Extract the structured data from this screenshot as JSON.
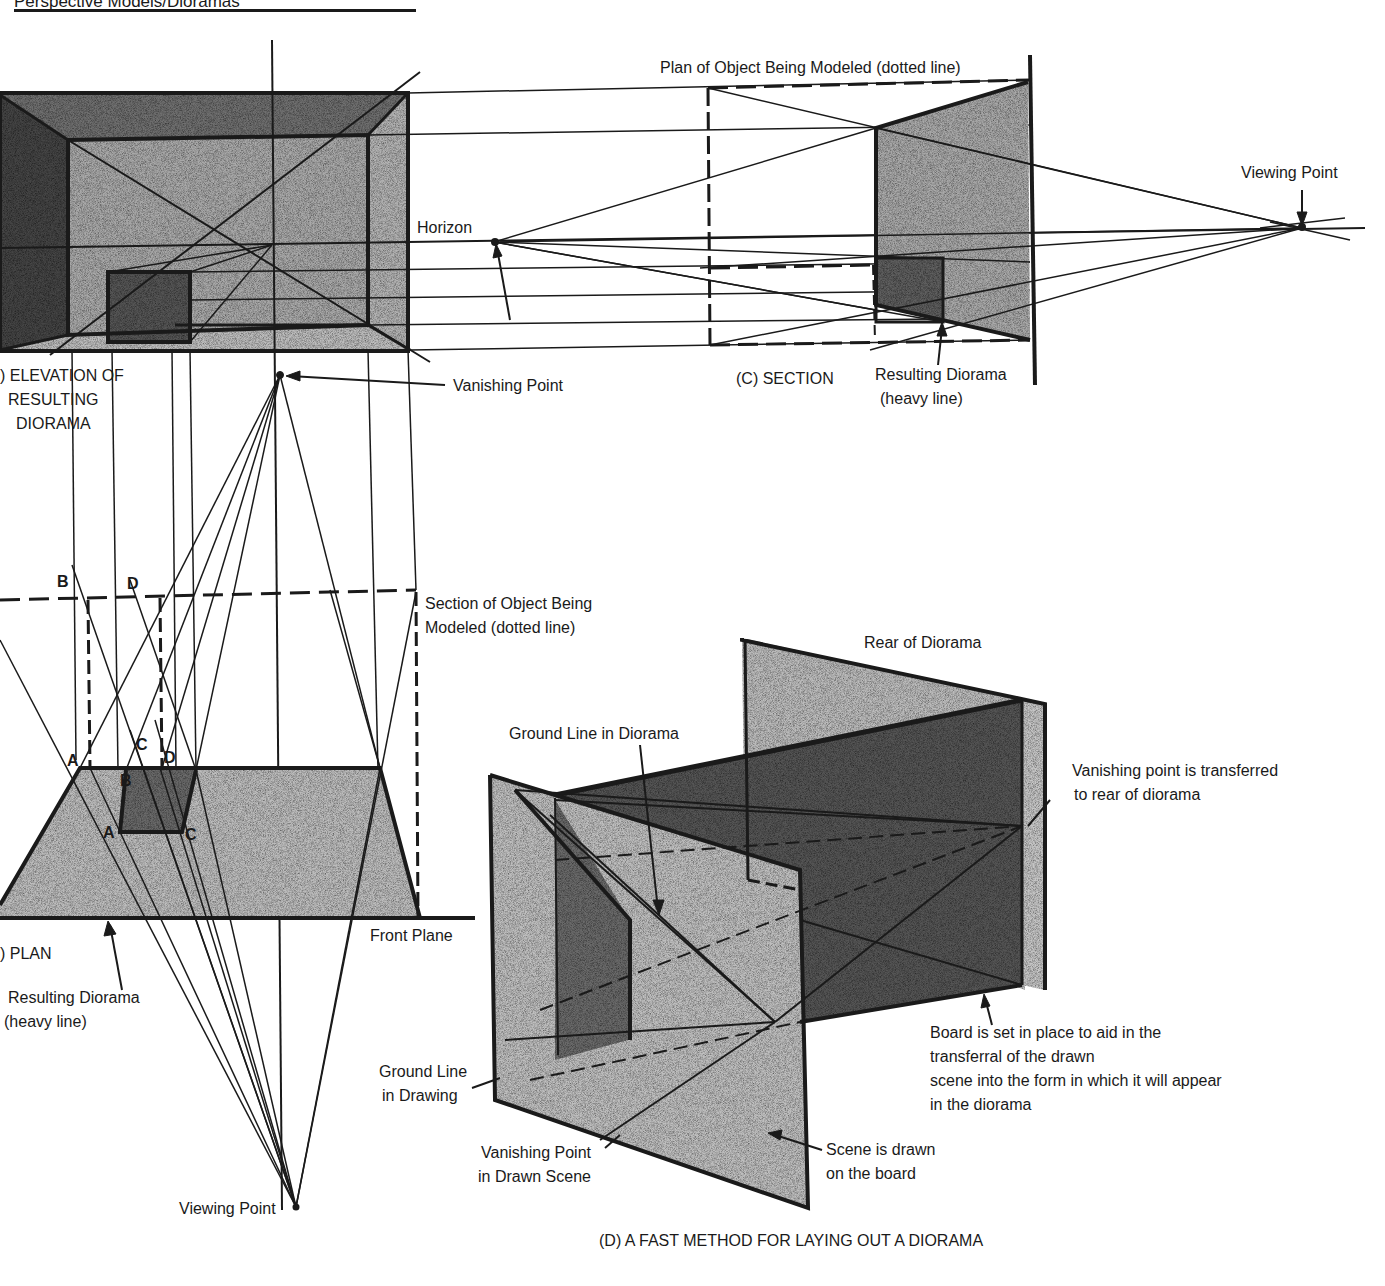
{
  "header": {
    "running_title": "Perspective Models/Dioramas"
  },
  "panel_a": {
    "caption_line1": ") ELEVATION OF",
    "caption_line2": "RESULTING",
    "caption_line3": "DIORAMA",
    "vanishing_point_label": "Vanishing Point",
    "horizon_label": "Horizon"
  },
  "panel_b": {
    "caption": ") PLAN",
    "section_label_line1": "Section of Object Being",
    "section_label_line2": "Modeled (dotted line)",
    "front_plane_label": "Front Plane",
    "resulting_label_line1": "Resulting Diorama",
    "resulting_label_line2": "(heavy line)",
    "viewing_point_label": "Viewing Point",
    "points": {
      "top_B": "B",
      "top_D": "D",
      "A_upper": "A",
      "C_upper": "C",
      "D_upper": "D",
      "B_lower": "B",
      "A_lower": "A",
      "C_lower": "C"
    }
  },
  "panel_c": {
    "plan_label": "Plan of Object Being Modeled (dotted line)",
    "caption": "(C) SECTION",
    "resulting_label_line1": "Resulting Diorama",
    "resulting_label_line2": "(heavy line)",
    "viewing_point_label": "Viewing Point"
  },
  "panel_d": {
    "rear_label": "Rear of Diorama",
    "ground_line_diorama_label": "Ground Line in Diorama",
    "vp_transferred_line1": "Vanishing point is transferred",
    "vp_transferred_line2": "to rear of diorama",
    "board_label_line1": "Board is set in place to aid in the",
    "board_label_line2": "transferral of the drawn",
    "board_label_line3": "scene into the form in which it will appear",
    "board_label_line4": "in the diorama",
    "ground_line_drawing_line1": "Ground Line",
    "ground_line_drawing_line2": "in Drawing",
    "vp_drawn_line1": "Vanishing Point",
    "vp_drawn_line2": "in Drawn Scene",
    "scene_drawn_line1": "Scene is drawn",
    "scene_drawn_line2": "on the board",
    "caption": "(D) A FAST METHOD FOR LAYING OUT A DIORAMA"
  },
  "colors": {
    "ink": "#1a1a1a",
    "stipple_light": "#c8c8c8",
    "stipple_mid": "#9a9a9a",
    "stipple_dark": "#5e5e5e",
    "paper": "#ffffff"
  }
}
